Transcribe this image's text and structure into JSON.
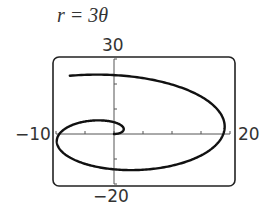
{
  "chart_data": {
    "type": "line",
    "title": "r = 3θ",
    "equation": "r = 3θ",
    "coordinate_system": "polar",
    "theta_range": [
      0,
      8.17
    ],
    "xlim": [
      -10,
      20
    ],
    "ylim": [
      -20,
      30
    ],
    "xscale_tick": 5,
    "yscale_tick": 10,
    "tick_labels": {
      "xmin": "−10",
      "xmax": "20",
      "ymax": "30",
      "ymin": "−20"
    },
    "grid": false,
    "series": [
      {
        "name": "r = 3θ",
        "description": "Archimedean spiral starting at origin, winding counterclockwise",
        "sample_points_xy": [
          [
            0,
            0
          ],
          [
            1.62,
            2.52
          ],
          [
            0,
            4.71
          ],
          [
            -2.96,
            4.61
          ],
          [
            -6.36,
            2.15
          ],
          [
            -9.42,
            0
          ],
          [
            -10.3,
            -5.0
          ],
          [
            -6.4,
            -11.3
          ],
          [
            0,
            -14.14
          ],
          [
            8.9,
            -13.9
          ],
          [
            15.4,
            -9.1
          ],
          [
            18.85,
            0
          ],
          [
            17.4,
            10.2
          ],
          [
            12.3,
            19.1
          ],
          [
            0,
            23.56
          ],
          [
            -7.4,
            23.4
          ]
        ],
        "color": "#111111"
      }
    ]
  }
}
